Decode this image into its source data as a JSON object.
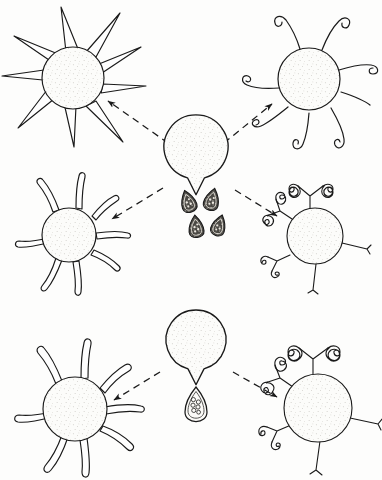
{
  "figure": {
    "title": "Spore release and cell-type differentiation diagram",
    "style": "ink line drawing, stippled shading, dashed arrows",
    "background_color": "#fdfdfc",
    "ink_color": "#1a1a1a",
    "canvas": {
      "width": 382,
      "height": 480
    },
    "panels": [
      {
        "id": "upper-panel",
        "name": "four-way-differentiation",
        "source": {
          "name": "source-body-upper",
          "shape": "pac-man sphere with basal notch",
          "cx": 196,
          "cy": 163,
          "r": 32,
          "fill": "#fbfbf9",
          "stipple": true
        },
        "emitted_spores": {
          "name": "spore-cluster-upper",
          "count": 4,
          "shape": "teardrop",
          "shading": "dark, stippled with pale internal vacuoles",
          "positions": [
            {
              "x": 188,
              "y": 201,
              "rot": -18,
              "w": 15,
              "h": 22
            },
            {
              "x": 212,
              "y": 199,
              "rot": 14,
              "w": 15,
              "h": 22
            },
            {
              "x": 196,
              "y": 226,
              "rot": -6,
              "w": 15,
              "h": 22
            },
            {
              "x": 219,
              "y": 225,
              "rot": 18,
              "w": 14,
              "h": 21
            }
          ]
        },
        "cells": [
          {
            "id": "upper-left-cell",
            "name": "spiny-cell",
            "appendage_type": "straight tapered spines",
            "appendage_count": 9,
            "cx": 73,
            "cy": 78,
            "r": 31,
            "arrow_from": [
              168,
              143
            ],
            "arrow_to": [
              108,
              101
            ]
          },
          {
            "id": "upper-right-cell",
            "name": "hooked-cell",
            "appendage_type": "slender hook-tipped filaments",
            "appendage_count": 8,
            "cx": 309,
            "cy": 79,
            "r": 31,
            "arrow_from": [
              224,
              143
            ],
            "arrow_to": [
              272,
              104
            ]
          },
          {
            "id": "middle-left-cell",
            "name": "blunt-tube-cell",
            "appendage_type": "blunt rounded tubular lobes",
            "appendage_count": 8,
            "cx": 69,
            "cy": 235,
            "r": 27,
            "arrow_from": [
              163,
              188
            ],
            "arrow_to": [
              112,
              219
            ]
          },
          {
            "id": "middle-right-cell",
            "name": "branched-coralloid-cell",
            "appendage_type": "branched antler-like arms with frilled lobes",
            "appendage_count": 5,
            "cx": 315,
            "cy": 236,
            "r": 28,
            "arrow_from": [
              235,
              190
            ],
            "arrow_to": [
              277,
              216
            ]
          }
        ],
        "arrows": {
          "name": "dashed-arrow",
          "style": "dashed line with solid triangular head",
          "dash": "7 5",
          "count": 4
        }
      },
      {
        "id": "lower-panel",
        "name": "two-way-differentiation",
        "source": {
          "name": "source-body-lower",
          "shape": "pac-man sphere with basal notch",
          "cx": 196,
          "cy": 355,
          "r": 30,
          "fill": "#fbfbf9",
          "stipple": true
        },
        "emitted_spores": {
          "name": "spore-cluster-lower",
          "count": 1,
          "shape": "teardrop",
          "shading": "pale outline with circular internal granules",
          "positions": [
            {
              "x": 196,
              "y": 404,
              "rot": 0,
              "w": 20,
              "h": 32
            }
          ]
        },
        "cells": [
          {
            "id": "lower-left-cell",
            "name": "blunt-tube-cell",
            "appendage_type": "blunt rounded tubular lobes",
            "appendage_count": 8,
            "cx": 75,
            "cy": 409,
            "r": 32,
            "arrow_from": [
              160,
              372
            ],
            "arrow_to": [
              114,
              400
            ]
          },
          {
            "id": "lower-right-cell",
            "name": "branched-coralloid-cell",
            "appendage_type": "branched antler-like arms with frilled lobes",
            "appendage_count": 5,
            "cx": 318,
            "cy": 408,
            "r": 34,
            "arrow_from": [
              233,
              372
            ],
            "arrow_to": [
              277,
              397
            ]
          }
        ],
        "arrows": {
          "name": "dashed-arrow",
          "style": "dashed line with solid triangular head",
          "dash": "7 5",
          "count": 2
        }
      }
    ]
  }
}
